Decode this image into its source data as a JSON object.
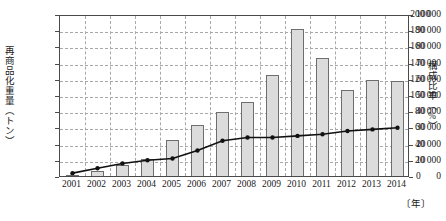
{
  "chart_data": {
    "type": "bar",
    "title": "",
    "subtitle": "",
    "xlabel": "〔年〕",
    "ylabel": "再商品化重量（トン）",
    "y2label": "構成比率（%）",
    "categories": [
      "2001",
      "2002",
      "2003",
      "2004",
      "2005",
      "2006",
      "2007",
      "2008",
      "2009",
      "2010",
      "2011",
      "2012",
      "2013",
      "2014"
    ],
    "ylim": [
      0,
      200000
    ],
    "y2lim": [
      0,
      100
    ],
    "yticks": [
      "0",
      "20 000",
      "40 000",
      "60 000",
      "80 000",
      "100 000",
      "120 000",
      "140 000",
      "160 000",
      "180 000",
      "200 000"
    ],
    "ytick_values": [
      0,
      20000,
      40000,
      60000,
      80000,
      100000,
      120000,
      140000,
      160000,
      180000,
      200000
    ],
    "y2ticks": [
      "0",
      "10",
      "20",
      "30",
      "40",
      "50",
      "60",
      "70",
      "80",
      "90",
      "100"
    ],
    "y2tick_values": [
      0,
      10,
      20,
      30,
      40,
      50,
      60,
      70,
      80,
      90,
      100
    ],
    "grid": true,
    "legend": "none",
    "series": [
      {
        "name": "再商品化重量",
        "type": "bar",
        "axis": "left",
        "values": [
          4000,
          9000,
          16000,
          24000,
          47000,
          65000,
          82000,
          94000,
          127000,
          184000,
          148000,
          109000,
          121000,
          120000
        ]
      },
      {
        "name": "構成比率",
        "type": "line",
        "axis": "right",
        "values": [
          3,
          6,
          9,
          11,
          12,
          17,
          23,
          25,
          25,
          26,
          27,
          29,
          30,
          31
        ]
      }
    ],
    "bar_color": "#dcdcdc",
    "bar_edge_color": "#6e6e6e",
    "line_color": "#111111",
    "marker": "circle",
    "grid_color": "#a8a8a8",
    "axis_color": "#4a4a4a"
  }
}
